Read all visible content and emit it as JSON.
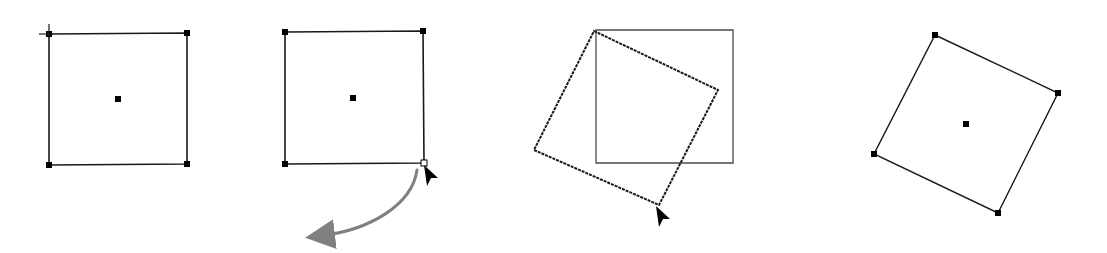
{
  "diagram": {
    "type": "rotation-steps",
    "colors": {
      "background": "#ffffff",
      "stroke": "#1a1a1a",
      "handle": "#000000",
      "rotation_arrow": "#808080",
      "original_outline": "#4a4a4a"
    },
    "steps": [
      {
        "id": "step-1-selected",
        "description": "Square selected with handles and center point",
        "square": [
          [
            49,
            34
          ],
          [
            187,
            33
          ],
          [
            187,
            164
          ],
          [
            49,
            165
          ]
        ],
        "handles": [
          [
            49,
            34
          ],
          [
            187,
            33
          ],
          [
            187,
            164
          ],
          [
            49,
            165
          ]
        ],
        "center": [
          118,
          99
        ],
        "crosshair": [
          49,
          34
        ]
      },
      {
        "id": "step-2-drag-corner",
        "description": "Cursor grabs bottom-right corner; curved arrow shows rotation direction",
        "square": [
          [
            285,
            32
          ],
          [
            423,
            31
          ],
          [
            424,
            163
          ],
          [
            285,
            164
          ]
        ],
        "handles": [
          [
            285,
            32
          ],
          [
            423,
            31
          ],
          [
            285,
            164
          ]
        ],
        "open_handle": [
          424,
          163
        ],
        "center": [
          353,
          98
        ],
        "cursor": [
          424,
          165
        ],
        "arrow_path": "M 417 170 C 412 205, 370 230, 320 236"
      },
      {
        "id": "step-3-rotating",
        "description": "Rotated outline preview over original square",
        "original_square": [
          [
            596,
            30
          ],
          [
            733,
            30
          ],
          [
            733,
            163
          ],
          [
            596,
            163
          ]
        ],
        "rotated_square": [
          [
            594,
            31
          ],
          [
            718,
            90
          ],
          [
            659,
            205
          ],
          [
            534,
            150
          ]
        ],
        "cursor": [
          656,
          206
        ]
      },
      {
        "id": "step-4-rotated",
        "description": "Final rotated square with handles and center",
        "square": [
          [
            935,
            35
          ],
          [
            1058,
            93
          ],
          [
            998,
            213
          ],
          [
            874,
            154
          ]
        ],
        "handles": [
          [
            935,
            35
          ],
          [
            1058,
            93
          ],
          [
            998,
            213
          ],
          [
            874,
            154
          ]
        ],
        "center": [
          966,
          124
        ]
      }
    ]
  }
}
